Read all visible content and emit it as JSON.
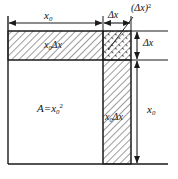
{
  "figure": {
    "kind": "geometry-diagram",
    "background": "#ffffff",
    "line_color": "#1a1a1a",
    "hatch_color": "#555555"
  },
  "labels": {
    "top_width": {
      "base": "x",
      "sub": "0",
      "sup": ""
    },
    "top_increment": {
      "base": "Δx",
      "sub": "",
      "sup": ""
    },
    "corner_square": {
      "base": "(Δx)",
      "sub": "",
      "sup": "2"
    },
    "right_increment": {
      "base": "Δx",
      "sub": "",
      "sup": ""
    },
    "right_height": {
      "base": "x",
      "sub": "0",
      "sup": ""
    },
    "top_band": {
      "base": "x",
      "sub": "0",
      "tail": "Δx"
    },
    "right_strip": {
      "base": "x",
      "sub": "0",
      "tail": "Δx"
    },
    "area": {
      "lead": "A=x",
      "sub": "0",
      "sup": "2"
    }
  },
  "text": {
    "x0": "x",
    "zero": "0",
    "delta_x": "Δx",
    "paren_delta_x": "(Δx)",
    "two": "2",
    "area_lead": "A=x"
  },
  "geometry": {
    "left_edge_x": 8,
    "inner_right_x": 103,
    "strip_right_x": 131,
    "ext_right_x": 168,
    "top_edge_y": 31,
    "band_bottom_y": 60,
    "bottom_edge_y": 164,
    "square_side_px": 95,
    "delta_px": 28
  }
}
